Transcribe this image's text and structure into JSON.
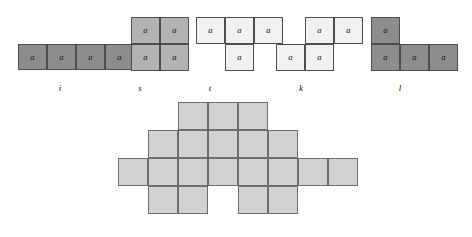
{
  "pieces": [
    {
      "id": "i",
      "label": "i",
      "shade": "shade-dark",
      "label_x": 60,
      "label_y": 84,
      "cells": [
        {
          "name": "a0",
          "text": "a",
          "sub": "0",
          "x": 18,
          "y": 44,
          "w": 29,
          "h": 26
        },
        {
          "name": "a1",
          "text": "a",
          "sub": "1",
          "x": 47,
          "y": 44,
          "w": 29,
          "h": 26
        },
        {
          "name": "a2",
          "text": "a",
          "sub": "2",
          "x": 76,
          "y": 44,
          "w": 29,
          "h": 26
        },
        {
          "name": "a3",
          "text": "a",
          "sub": "3",
          "x": 105,
          "y": 44,
          "w": 29,
          "h": 26
        }
      ]
    },
    {
      "id": "s",
      "label": "s",
      "shade": "shade-mid",
      "label_x": 140,
      "label_y": 84,
      "cells": [
        {
          "name": "a4",
          "text": "a",
          "sub": "4",
          "x": 131,
          "y": 17,
          "w": 29,
          "h": 27
        },
        {
          "name": "a5",
          "text": "a",
          "sub": "5",
          "x": 160,
          "y": 17,
          "w": 29,
          "h": 27
        },
        {
          "name": "a7",
          "text": "a",
          "sub": "7",
          "x": 131,
          "y": 44,
          "w": 29,
          "h": 27
        },
        {
          "name": "a6",
          "text": "a",
          "sub": "6",
          "x": 160,
          "y": 44,
          "w": 29,
          "h": 27
        }
      ]
    },
    {
      "id": "t",
      "label": "t",
      "shade": "shade-light",
      "label_x": 210,
      "label_y": 84,
      "cells": [
        {
          "name": "a8",
          "text": "a",
          "sub": "8",
          "x": 196,
          "y": 17,
          "w": 29,
          "h": 27
        },
        {
          "name": "a9",
          "text": "a",
          "sub": "9",
          "x": 225,
          "y": 17,
          "w": 29,
          "h": 27
        },
        {
          "name": "a10",
          "text": "a",
          "sub": "10",
          "x": 254,
          "y": 17,
          "w": 29,
          "h": 27
        },
        {
          "name": "a11",
          "text": "a",
          "sub": "11",
          "x": 225,
          "y": 44,
          "w": 29,
          "h": 27
        }
      ]
    },
    {
      "id": "k",
      "label": "k",
      "shade": "shade-light",
      "label_x": 301,
      "label_y": 84,
      "cells": [
        {
          "name": "a14",
          "text": "a",
          "sub": "14",
          "x": 305,
          "y": 17,
          "w": 29,
          "h": 27
        },
        {
          "name": "a15",
          "text": "a",
          "sub": "15",
          "x": 334,
          "y": 17,
          "w": 29,
          "h": 27
        },
        {
          "name": "a12",
          "text": "a",
          "sub": "12",
          "x": 276,
          "y": 44,
          "w": 29,
          "h": 27
        },
        {
          "name": "a13",
          "text": "a",
          "sub": "13",
          "x": 305,
          "y": 44,
          "w": 29,
          "h": 27
        }
      ]
    },
    {
      "id": "l",
      "label": "l",
      "shade": "shade-dark",
      "label_x": 400,
      "label_y": 84,
      "cells": [
        {
          "name": "a16",
          "text": "a",
          "sub": "16",
          "x": 371,
          "y": 17,
          "w": 29,
          "h": 27
        },
        {
          "name": "a17",
          "text": "a",
          "sub": "17",
          "x": 371,
          "y": 44,
          "w": 29,
          "h": 27
        },
        {
          "name": "a18",
          "text": "a",
          "sub": "18",
          "x": 400,
          "y": 44,
          "w": 29,
          "h": 27
        },
        {
          "name": "a19",
          "text": "a",
          "sub": "19",
          "x": 429,
          "y": 44,
          "w": 29,
          "h": 27
        }
      ]
    }
  ],
  "board": {
    "name": "assembled-board",
    "origin_x": 118,
    "origin_y": 102,
    "cell_w": 30,
    "cell_h": 28,
    "rows": 4,
    "cols": 8,
    "occupied": [
      [
        0,
        0,
        1,
        1,
        1,
        0,
        0,
        0
      ],
      [
        0,
        1,
        1,
        1,
        1,
        1,
        0,
        0
      ],
      [
        1,
        1,
        1,
        1,
        1,
        1,
        1,
        1
      ],
      [
        0,
        1,
        1,
        0,
        1,
        1,
        0,
        0
      ]
    ]
  }
}
